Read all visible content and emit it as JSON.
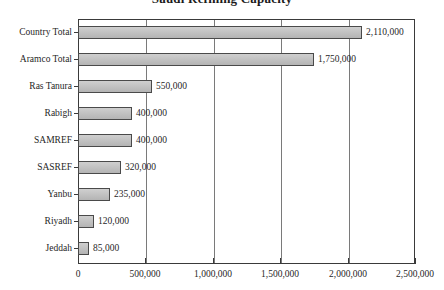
{
  "chart_data": {
    "type": "bar",
    "orientation": "horizontal",
    "title": "Saudi Refining Capacity",
    "xlabel": "",
    "ylabel": "",
    "categories": [
      "Country Total",
      "Aramco Total",
      "Ras Tanura",
      "Rabigh",
      "SAMREF",
      "SASREF",
      "Yanbu",
      "Riyadh",
      "Jeddah"
    ],
    "values": [
      2110000,
      1750000,
      550000,
      400000,
      400000,
      320000,
      235000,
      120000,
      85000
    ],
    "data_labels": [
      "2,110,000",
      "1,750,000",
      "550,000",
      "400,000",
      "400,000",
      "320,000",
      "235,000",
      "120,000",
      "85,000"
    ],
    "xlim": [
      0,
      2500000
    ],
    "xticks": [
      0,
      500000,
      1000000,
      1500000,
      2000000,
      2500000
    ],
    "xtick_labels": [
      "0",
      "500,000",
      "1,000,000",
      "1,500,000",
      "2,000,000",
      "2,500,000"
    ],
    "grid": "vertical",
    "legend": "none",
    "colors": {
      "bar_fill": "#c2c2c2",
      "bar_border": "#4a4a4a",
      "gridline": "#7a7a7a",
      "axis": "#3a3a3a",
      "text": "#1f1f1f",
      "background": "#ffffff"
    }
  }
}
